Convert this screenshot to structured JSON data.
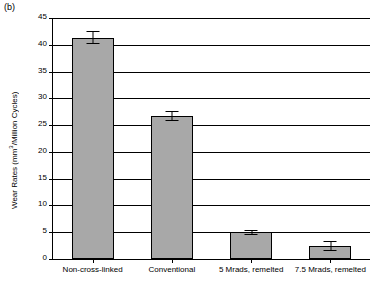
{
  "panel_label": "(b)",
  "chart_data": {
    "type": "bar",
    "title": "",
    "xlabel": "",
    "ylabel": "Wear Rates (mm3/Million Cycles)",
    "ylabel_base": "Wear Rates (mm",
    "ylabel_sup": "3",
    "ylabel_rest": "/Million Cycles)",
    "categories": [
      "Non-cross-linked",
      "Conventional",
      "5 Mrads, remelted",
      "7.5 Mrads, remelted"
    ],
    "values": [
      41.3,
      26.7,
      5.0,
      2.4
    ],
    "errors": [
      1.2,
      1.0,
      0.5,
      0.9
    ],
    "ylim": [
      0,
      45
    ],
    "yticks": [
      0,
      5,
      10,
      15,
      20,
      25,
      30,
      35,
      40,
      45
    ],
    "ytick_labels": [
      "0",
      "5",
      "10",
      "15",
      "20",
      "25",
      "30",
      "35",
      "40",
      "45"
    ],
    "grid": true,
    "legend": null,
    "bar_color": "#a8a8a8",
    "edge_color": "#000000"
  }
}
